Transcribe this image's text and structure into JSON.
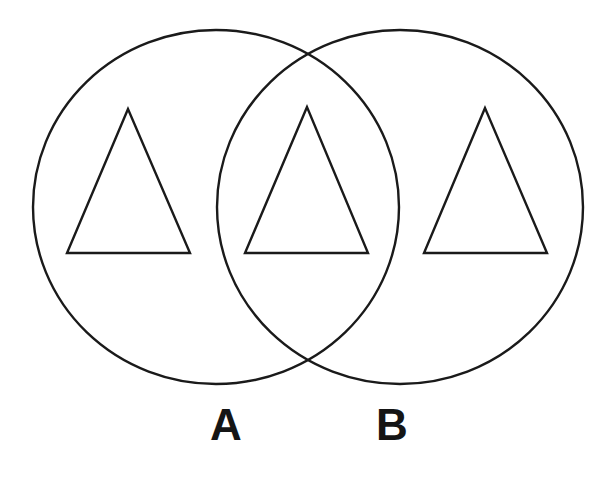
{
  "diagram": {
    "type": "venn",
    "stroke_color": "#1a1a1a",
    "background": "#ffffff",
    "sets": [
      {
        "id": "A",
        "label": "A",
        "cx": 216,
        "cy": 207,
        "rx": 183,
        "ry": 177
      },
      {
        "id": "B",
        "label": "B",
        "cx": 400,
        "cy": 207,
        "rx": 183,
        "ry": 177
      }
    ],
    "regions": [
      {
        "name": "A only",
        "symbol": "triangle",
        "points": [
          [
            128,
            109
          ],
          [
            67,
            253
          ],
          [
            190,
            253
          ]
        ]
      },
      {
        "name": "A and B",
        "symbol": "triangle",
        "points": [
          [
            307,
            107
          ],
          [
            245,
            253
          ],
          [
            368,
            253
          ]
        ]
      },
      {
        "name": "B only",
        "symbol": "triangle",
        "points": [
          [
            485,
            108
          ],
          [
            424,
            253
          ],
          [
            547,
            253
          ]
        ]
      }
    ]
  },
  "labels": {
    "a": "A",
    "b": "B"
  }
}
